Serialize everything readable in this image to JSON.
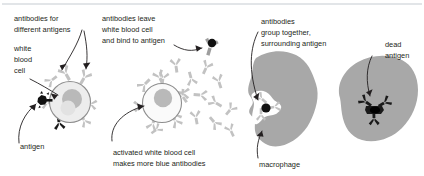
{
  "figure": {
    "background_color": "#ffffff",
    "text_color": "#231f20",
    "width": 424,
    "height": 176
  },
  "palette": {
    "antibody_gray": "#c2c2c2",
    "antibody_dark_gray": "#9e9e9e",
    "antibody_black": "#1a1a1a",
    "cell_fill": "#ededed",
    "cell_fill_light": "#fafafa",
    "nucleus": "#b9b9b9",
    "macrophage_gray": "#a8a8a8",
    "antigen_black": "#111111",
    "rule_gray": "#d9dde0"
  },
  "labels": {
    "antibodies_different_antigens_line1": "antibodies for",
    "antibodies_different_antigens_line2": "different antigens",
    "white_blood_cell_line1": "white",
    "white_blood_cell_line2": "blood",
    "white_blood_cell_line3": "cell",
    "antigen": "antigen",
    "antibodies_leave_line1": "antibodies leave",
    "antibodies_leave_line2": "white blood cell",
    "antibodies_leave_line3": "and bind to antigen",
    "activated_cell_line1": "activated white blood cell",
    "activated_cell_line2": "makes more blue antibodies",
    "antibodies_group_line1": "antibodies",
    "antibodies_group_line2": "group together,",
    "antibodies_group_line3": "surrounding antigen",
    "macrophage": "macrophage",
    "dead_antigen_line1": "dead",
    "dead_antigen_line2": "antigen"
  },
  "panels": [
    {
      "id": "panel-1",
      "name": "white-blood-cell-with-antigen",
      "caption_keys": [
        "antibodies_different_antigens_line1",
        "white_blood_cell_line1",
        "antigen"
      ],
      "description": "White blood cell with surface antibodies binding an antigen"
    },
    {
      "id": "panel-2",
      "name": "activated-white-blood-cell",
      "caption_keys": [
        "antibodies_leave_line1",
        "activated_cell_line1"
      ],
      "description": "Activated white blood cell releasing many antibodies"
    },
    {
      "id": "panel-3",
      "name": "macrophage-engulfing-antigen",
      "caption_keys": [
        "antibodies_group_line1",
        "macrophage"
      ],
      "description": "Macrophage engulfing the antibody-coated antigen"
    },
    {
      "id": "panel-4",
      "name": "dead-antigen-inside-macrophage",
      "caption_keys": [
        "dead_antigen_line1"
      ],
      "description": "Dead antigen digested inside the macrophage"
    }
  ]
}
